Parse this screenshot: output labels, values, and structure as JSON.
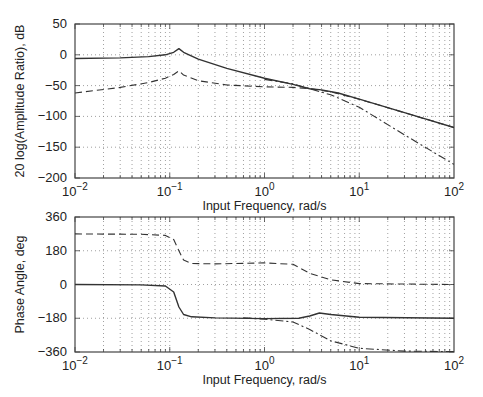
{
  "chart_data": [
    {
      "type": "line",
      "title": "",
      "xlabel": "Input Frequency, rad/s",
      "ylabel": "20 log(Amplitude Ratio), dB",
      "xscale": "log",
      "xlim": [
        0.01,
        100
      ],
      "ylim": [
        -200,
        50
      ],
      "xticks": [
        0.01,
        0.1,
        1,
        10,
        100
      ],
      "xtick_labels": [
        "10^-2",
        "10^-1",
        "10^0",
        "10^1",
        "10^2"
      ],
      "yticks": [
        50,
        0,
        -50,
        -100,
        -150,
        -200
      ],
      "ytick_labels": [
        "50",
        "0",
        "-50",
        "-100",
        "-150",
        "-200"
      ],
      "grid": true,
      "legend": null,
      "series": [
        {
          "name": "solid",
          "style": "solid",
          "x": [
            0.01,
            0.03,
            0.06,
            0.09,
            0.11,
            0.125,
            0.14,
            0.2,
            0.4,
            1,
            2,
            3,
            4,
            6,
            10,
            30,
            100
          ],
          "y": [
            -6,
            -5,
            -3,
            0,
            4,
            10,
            4,
            -7,
            -22,
            -38,
            -48,
            -55,
            -57,
            -62,
            -72,
            -94,
            -118
          ]
        },
        {
          "name": "dashed",
          "style": "dashed",
          "x": [
            0.01,
            0.03,
            0.06,
            0.09,
            0.11,
            0.125,
            0.14,
            0.2,
            0.4,
            1,
            2,
            3,
            5,
            10,
            30,
            100
          ],
          "y": [
            -62,
            -53,
            -45,
            -38,
            -32,
            -26,
            -33,
            -42,
            -49,
            -52,
            -53,
            -55,
            -60,
            -72,
            -94,
            -118
          ]
        },
        {
          "name": "dash-dot",
          "style": "dashdot",
          "x": [
            1,
            2,
            3,
            5,
            10,
            30,
            100
          ],
          "y": [
            -40,
            -47,
            -55,
            -65,
            -85,
            -130,
            -178
          ]
        }
      ]
    },
    {
      "type": "line",
      "title": "",
      "xlabel": "Input Frequency, rad/s",
      "ylabel": "Phase Angle, deg",
      "xscale": "log",
      "xlim": [
        0.01,
        100
      ],
      "ylim": [
        -360,
        360
      ],
      "xticks": [
        0.01,
        0.1,
        1,
        10,
        100
      ],
      "xtick_labels": [
        "10^-2",
        "10^-1",
        "10^0",
        "10^1",
        "10^2"
      ],
      "yticks": [
        360,
        180,
        0,
        -180,
        -360
      ],
      "ytick_labels": [
        "360",
        "180",
        "0",
        "-180",
        "-360"
      ],
      "grid": true,
      "legend": null,
      "series": [
        {
          "name": "solid",
          "style": "solid",
          "x": [
            0.01,
            0.05,
            0.09,
            0.11,
            0.125,
            0.14,
            0.17,
            0.3,
            1,
            2.3,
            3,
            3.8,
            5,
            10,
            100
          ],
          "y": [
            0,
            -2,
            -8,
            -40,
            -120,
            -160,
            -172,
            -178,
            -182,
            -180,
            -168,
            -152,
            -160,
            -175,
            -180
          ]
        },
        {
          "name": "dashed",
          "style": "dashed",
          "x": [
            0.01,
            0.05,
            0.09,
            0.11,
            0.125,
            0.14,
            0.17,
            0.3,
            1,
            2,
            3,
            5,
            10,
            100
          ],
          "y": [
            270,
            268,
            262,
            240,
            180,
            130,
            112,
            110,
            115,
            108,
            60,
            25,
            5,
            0
          ]
        },
        {
          "name": "dash-dot",
          "style": "dashdot",
          "x": [
            0.6,
            1,
            2,
            3,
            5,
            10,
            30,
            100
          ],
          "y": [
            -178,
            -185,
            -200,
            -240,
            -300,
            -340,
            -355,
            -358
          ]
        }
      ]
    }
  ],
  "layout": {
    "plots": [
      {
        "left": 75,
        "top": 24,
        "right": 454,
        "bottom": 178
      },
      {
        "left": 75,
        "top": 217,
        "right": 454,
        "bottom": 352
      }
    ]
  }
}
